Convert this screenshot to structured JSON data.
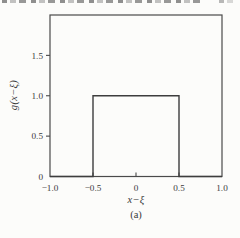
{
  "figure": {
    "caption": "(a)"
  },
  "chart_data": {
    "type": "line",
    "title": "",
    "xlabel": "x−ξ",
    "ylabel": "g(x−ξ)",
    "caption": "(a)",
    "xlim": [
      -1.0,
      1.0
    ],
    "ylim": [
      0,
      2.0
    ],
    "x_ticks": [
      -1.0,
      -0.5,
      0,
      0.5,
      1.0
    ],
    "x_tick_labels": [
      "−1.0",
      "−0.5",
      "0",
      "0.5",
      "1.0"
    ],
    "y_ticks": [
      0,
      0.5,
      1.0,
      1.5
    ],
    "y_tick_labels": [
      "0",
      "0.5",
      "1.0",
      "1.5"
    ],
    "grid": false,
    "legend": null,
    "series": [
      {
        "name": "rectangular-pulse g(x-xi)",
        "x": [
          -1.0,
          -0.5,
          -0.5,
          0.5,
          0.5,
          1.0
        ],
        "y": [
          0,
          0,
          1.0,
          1.0,
          0,
          0
        ]
      }
    ],
    "colors": {
      "frame": "#4a4a4a",
      "line": "#3d3d3d",
      "tick": "#4a4a4a",
      "text": "#3a3a3a",
      "background": "#fcfcfa"
    }
  }
}
